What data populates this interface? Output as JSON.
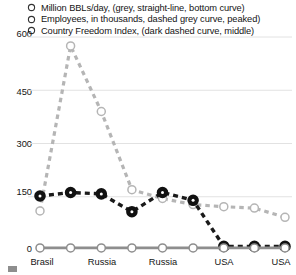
{
  "chart_data": {
    "type": "line",
    "title": "",
    "xlabel": "",
    "ylabel": "",
    "ylim": [
      0,
      600
    ],
    "yticks": [
      0,
      150,
      300,
      450,
      600
    ],
    "grid": true,
    "legend_position": "top",
    "categories": [
      "Brasil",
      "",
      "Russia",
      "",
      "Russia",
      "",
      "USA",
      "",
      "USA"
    ],
    "xtick_labels": [
      "Brasil",
      "Russia",
      "Russia",
      "USA",
      "USA"
    ],
    "series": [
      {
        "name": "Million BBLs/day, (grey, straight-line, bottom curve)",
        "short_name": "Million BBLs/day",
        "color": "#8e8e8e",
        "style": "solid",
        "marker": "circle-open",
        "values": [
          6,
          6,
          6,
          6,
          6,
          6,
          6,
          6,
          6
        ]
      },
      {
        "name": "Employees, in thousands, dashed grey curve, peaked)",
        "short_name": "Employees, in thousands",
        "color": "#b5b5b5",
        "style": "dashed",
        "marker": "circle-open",
        "values": [
          110,
          575,
          390,
          170,
          145,
          128,
          122,
          118,
          92
        ]
      },
      {
        "name": "Country Freedom Index, (dark dashed curve, middle)",
        "short_name": "Country Freedom Index",
        "color": "#1a1a1a",
        "style": "dashed",
        "marker": "circle-filled",
        "values": [
          152,
          162,
          158,
          108,
          162,
          140,
          10,
          10,
          10
        ]
      }
    ]
  },
  "legend": {
    "items": [
      {
        "marker": "circle-open-icon",
        "label": "Million BBLs/day, (grey, straight-line, bottom curve)"
      },
      {
        "marker": "circle-open-icon",
        "label": "Employees, in thousands, dashed grey curve, peaked)"
      },
      {
        "marker": "circle-open-icon",
        "label": "Country Freedom Index, (dark dashed curve, middle)"
      }
    ]
  },
  "y_axis": {
    "ticks": [
      {
        "value": "600"
      },
      {
        "value": "450"
      },
      {
        "value": "300"
      },
      {
        "value": "150"
      },
      {
        "value": "0"
      }
    ]
  },
  "x_axis": {
    "ticks": [
      {
        "label": "Brasil"
      },
      {
        "label": "Russia"
      },
      {
        "label": "Russia"
      },
      {
        "label": "USA"
      },
      {
        "label": "USA"
      }
    ]
  }
}
